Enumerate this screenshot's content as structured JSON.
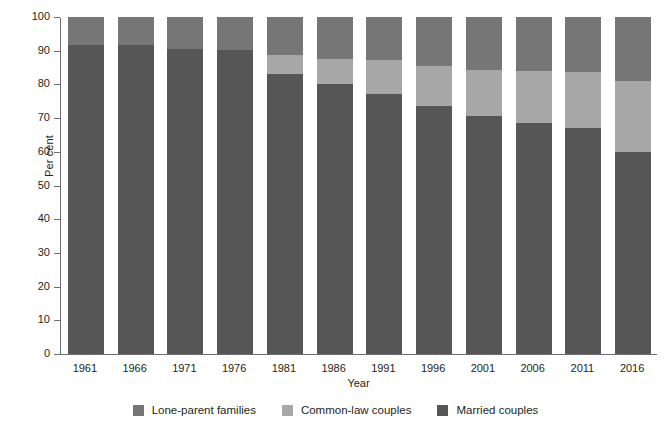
{
  "chart_data": {
    "type": "bar",
    "subtype": "stacked-bar-100",
    "title": "",
    "xlabel": "Year",
    "ylabel": "Per cent",
    "ylim": [
      0,
      100
    ],
    "yticks": [
      0,
      10,
      20,
      30,
      40,
      50,
      60,
      70,
      80,
      90,
      100
    ],
    "grid": false,
    "legend_position": "bottom",
    "stack_order_bottom_to_top": [
      "Married couples",
      "Common-law couples",
      "Lone-parent families"
    ],
    "categories": [
      "1961",
      "1966",
      "1971",
      "1976",
      "1981",
      "1986",
      "1991",
      "1996",
      "2001",
      "2006",
      "2011",
      "2016"
    ],
    "series": [
      {
        "name": "Married couples",
        "color": "#565656",
        "values": [
          91.6,
          91.8,
          90.6,
          90.2,
          83.1,
          80.2,
          77.2,
          73.7,
          70.5,
          68.6,
          67.0,
          60.0
        ]
      },
      {
        "name": "Common-law couples",
        "color": "#a7a7a7",
        "values": [
          0.0,
          0.0,
          0.0,
          0.0,
          5.6,
          7.2,
          9.9,
          11.7,
          13.8,
          15.5,
          16.7,
          21.0
        ]
      },
      {
        "name": "Lone-parent families",
        "color": "#767676",
        "values": [
          8.4,
          8.2,
          9.4,
          9.8,
          11.3,
          12.6,
          12.9,
          14.6,
          15.7,
          15.9,
          16.3,
          19.0
        ]
      }
    ]
  },
  "axes": {
    "y_title": "Per cent",
    "x_title": "Year",
    "y_tick_labels": [
      "0",
      "10",
      "20",
      "30",
      "40",
      "50",
      "60",
      "70",
      "80",
      "90",
      "100"
    ],
    "x_tick_labels": [
      "1961",
      "1966",
      "1971",
      "1976",
      "1981",
      "1986",
      "1991",
      "1996",
      "2001",
      "2006",
      "2011",
      "2016"
    ]
  },
  "legend": {
    "items": [
      {
        "label": "Lone-parent families",
        "color": "#767676"
      },
      {
        "label": "Common-law couples",
        "color": "#a7a7a7"
      },
      {
        "label": "Married couples",
        "color": "#565656"
      }
    ]
  },
  "colors": {
    "married": "#565656",
    "common_law": "#a7a7a7",
    "lone_parent": "#767676",
    "axis": "#6d6e71",
    "text": "#231f20",
    "background": "#ffffff"
  }
}
